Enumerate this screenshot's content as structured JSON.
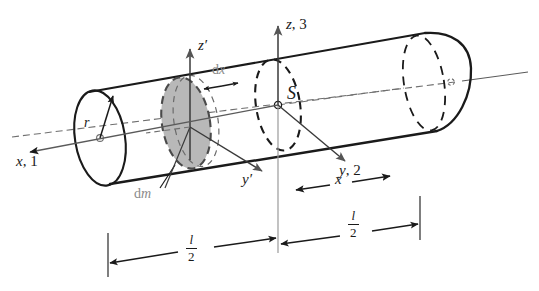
{
  "figure": {
    "background_color": "#ffffff",
    "ink_color": "#1a1a1a",
    "gray_color": "#8a8a8a",
    "shaded_fill": "#b3b3b3",
    "shaded_stroke": "#4d4d4d"
  },
  "labels": {
    "z_prime": {
      "sym": "z",
      "prime": "′"
    },
    "z_axis": {
      "sym": "z",
      "rest": ", 3"
    },
    "x_axis": {
      "sym": "x",
      "rest": ", 1"
    },
    "y_axis": {
      "sym": "y",
      "rest": ", 2"
    },
    "y_prime": {
      "sym": "y",
      "prime": "′"
    },
    "centre_of_mass": "S",
    "radius": "r",
    "thickness": {
      "d": "d",
      "var": "x"
    },
    "mass_element": {
      "d": "d",
      "var": "m"
    },
    "distance_x": "x"
  },
  "dimensions": [
    {
      "name": "half-length-left",
      "numerator": "l",
      "denominator": "2"
    },
    {
      "name": "half-length-right",
      "numerator": "l",
      "denominator": "2"
    }
  ]
}
